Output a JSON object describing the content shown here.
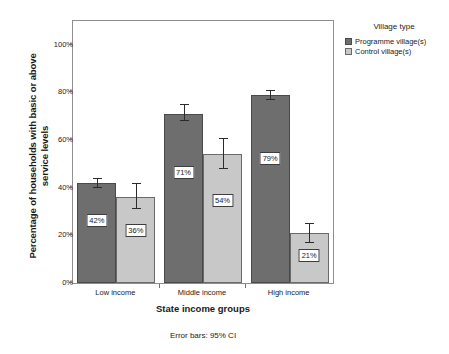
{
  "chart_data": {
    "type": "bar",
    "title": "",
    "subtitle": "",
    "xlabel": "State income groups",
    "ylabel": "Percentage of households with basic or above service levels",
    "ylabel_line1": "Percentage of households with basic or above",
    "ylabel_line2": "service levels",
    "categories": [
      "Low income",
      "Middle income",
      "High income"
    ],
    "ylim": [
      0,
      110
    ],
    "y_ticks": [
      0,
      20,
      40,
      60,
      80,
      100
    ],
    "y_tick_labels": [
      "0%",
      "20%",
      "40%",
      "60%",
      "80%",
      "100%"
    ],
    "grid": false,
    "legend_position": "right",
    "legend_title": "Village type",
    "annotation": "Error bars: 95% CI",
    "series": [
      {
        "name": "Programme village(s)",
        "color": "#6e6e6e",
        "values": [
          42,
          71,
          79
        ],
        "value_labels": [
          "42%",
          "71%",
          "79%"
        ],
        "ci_low": [
          40,
          68,
          77
        ],
        "ci_high": [
          44,
          75,
          81
        ]
      },
      {
        "name": "Control village(s)",
        "color": "#c8c8c8",
        "values": [
          36,
          54,
          21
        ],
        "value_labels": [
          "36%",
          "54%",
          "21%"
        ],
        "ci_low": [
          31,
          48,
          17
        ],
        "ci_high": [
          42,
          61,
          25
        ]
      }
    ]
  },
  "figure": {
    "frame_color": "#8e8e8e",
    "background": "#ffffff"
  }
}
